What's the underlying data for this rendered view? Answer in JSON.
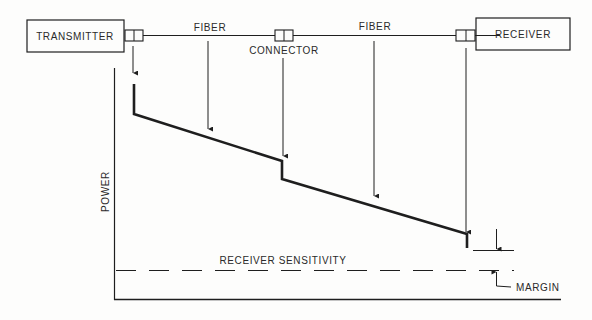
{
  "diagram": {
    "blocks": {
      "transmitter": "TRANSMITTER",
      "receiver": "RECEIVER"
    },
    "labels": {
      "fiber_1": "FIBER",
      "connector": "CONNECTOR",
      "fiber_2": "FIBER",
      "y_axis": "POWER",
      "receiver_sensitivity": "RECEIVER SENSITIVITY",
      "margin": "MARGIN"
    },
    "colors": {
      "line": "#1e1e1e",
      "text": "#2a2a2a",
      "background": "#fdfdfc"
    }
  }
}
